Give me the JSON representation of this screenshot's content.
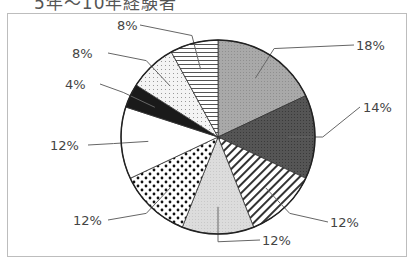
{
  "title": "5年～10年経験者",
  "chart_data": {
    "type": "pie",
    "title": "5年～10年経験者",
    "start_angle_deg": 0,
    "direction": "clockwise",
    "slices": [
      {
        "label": "18%",
        "value": 18,
        "pattern": "medium-gray-screen"
      },
      {
        "label": "14%",
        "value": 14,
        "pattern": "dark-gray-screen"
      },
      {
        "label": "12%",
        "value": 12,
        "pattern": "diagonal-hatch"
      },
      {
        "label": "12%",
        "value": 12,
        "pattern": "light-gray-screen"
      },
      {
        "label": "12%",
        "value": 12,
        "pattern": "large-dots"
      },
      {
        "label": "12%",
        "value": 12,
        "pattern": "white"
      },
      {
        "label": "4%",
        "value": 4,
        "pattern": "black"
      },
      {
        "label": "8%",
        "value": 8,
        "pattern": "fine-dots"
      },
      {
        "label": "8%",
        "value": 8,
        "pattern": "horizontal-stripes"
      }
    ],
    "legend": "none",
    "labels": "leader-lines"
  }
}
